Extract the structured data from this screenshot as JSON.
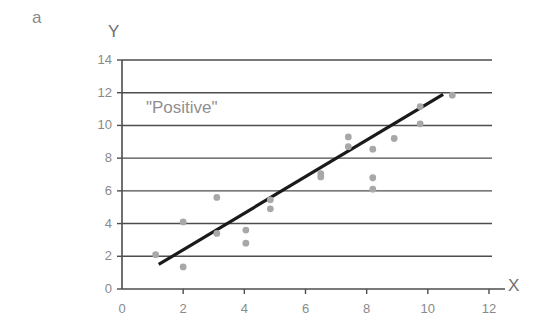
{
  "panel": {
    "letter": "a"
  },
  "annotation": {
    "text": "\"Positive\""
  },
  "axis_titles": {
    "x": "X",
    "y": "Y"
  },
  "colors": {
    "point": "#a8a8a8",
    "trend_line": "#1a1a1a",
    "grid": "#4d4d4d",
    "axis": "#4d4d4d",
    "tick_text": "#8a8a8a",
    "annotation_text": "#8f8f8f",
    "background": "#ffffff"
  },
  "chart_data": {
    "type": "scatter",
    "title": "a",
    "xlabel": "X",
    "ylabel": "Y",
    "annotations": [
      "\"Positive\""
    ],
    "xlim": [
      0,
      12.4
    ],
    "ylim": [
      0,
      14
    ],
    "xticks": [
      0,
      2,
      4,
      6,
      8,
      10,
      12
    ],
    "yticks": [
      0,
      2,
      4,
      6,
      8,
      10,
      12,
      14
    ],
    "xtick_labels": [
      "0",
      "2",
      "4",
      "6",
      "8",
      "10",
      "12"
    ],
    "ytick_labels": [
      "0",
      "2",
      "4",
      "6",
      "8",
      "10",
      "12",
      "14"
    ],
    "grid": "horizontal",
    "legend": "none",
    "points": [
      {
        "x": 1.1,
        "y": 2.1
      },
      {
        "x": 2.0,
        "y": 4.1
      },
      {
        "x": 2.0,
        "y": 1.35
      },
      {
        "x": 3.1,
        "y": 5.6
      },
      {
        "x": 3.1,
        "y": 3.4
      },
      {
        "x": 4.05,
        "y": 3.6
      },
      {
        "x": 4.05,
        "y": 2.8
      },
      {
        "x": 4.85,
        "y": 5.45
      },
      {
        "x": 4.85,
        "y": 4.9
      },
      {
        "x": 6.5,
        "y": 7.05
      },
      {
        "x": 6.5,
        "y": 6.85
      },
      {
        "x": 7.4,
        "y": 9.3
      },
      {
        "x": 7.4,
        "y": 8.7
      },
      {
        "x": 8.2,
        "y": 8.55
      },
      {
        "x": 8.2,
        "y": 6.8
      },
      {
        "x": 8.2,
        "y": 6.1
      },
      {
        "x": 8.9,
        "y": 9.2
      },
      {
        "x": 9.75,
        "y": 11.15
      },
      {
        "x": 9.75,
        "y": 10.1
      },
      {
        "x": 10.8,
        "y": 11.85
      }
    ],
    "trend_line": {
      "x0": 1.2,
      "y0": 1.5,
      "x1": 10.5,
      "y1": 11.9
    }
  }
}
